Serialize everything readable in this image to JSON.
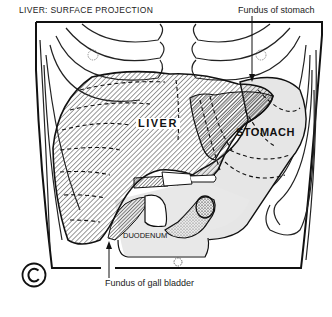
{
  "diagram": {
    "title": "LIVER: SURFACE PROJECTION",
    "labels": {
      "fundus_stomach": "Fundus of stomach",
      "fundus_gallbladder": "Fundus of gall bladder",
      "liver": "LIVER",
      "stomach": "STOMACH",
      "duodenum": "DUODENUM"
    },
    "copyright_symbol": "copyright-icon",
    "colors": {
      "line": "#111111",
      "stomach_fill": "#e6e6e6",
      "background": "#ffffff"
    }
  }
}
